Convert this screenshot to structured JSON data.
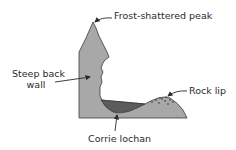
{
  "diagram": {
    "colors": {
      "rock": "#a8a8a8",
      "lochan": "#5c5c5c",
      "outline": "#3a3a3a",
      "text": "#2a2a2a"
    },
    "labels": {
      "peak": "Frost-shattered peak",
      "back_wall_line1": "Steep back",
      "back_wall_line2": "wall",
      "rock_lip": "Rock lip",
      "lochan": "Corrie lochan"
    }
  }
}
